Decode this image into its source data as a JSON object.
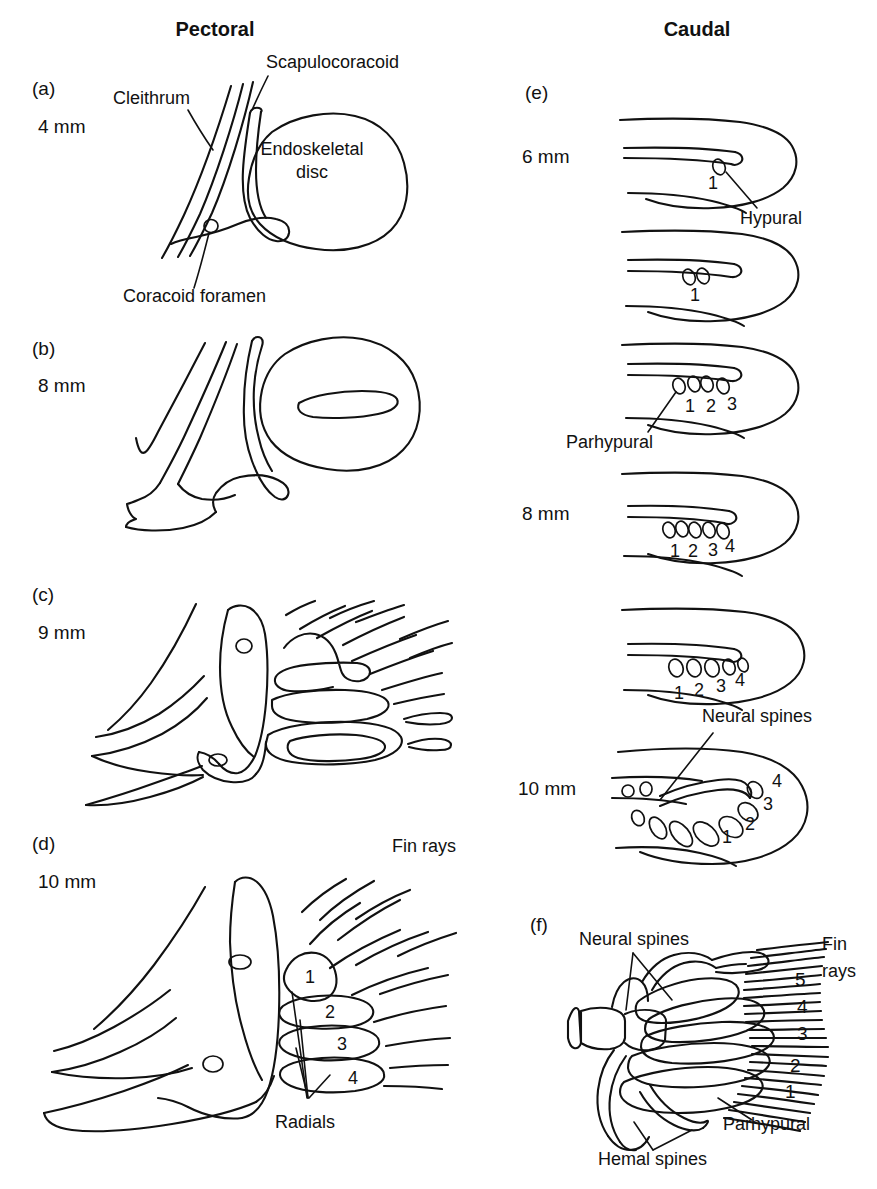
{
  "figure": {
    "background": "#ffffff",
    "ink_color": "#111111",
    "headings": [
      {
        "id": "pectoral",
        "label": "Pectoral"
      },
      {
        "id": "caudal",
        "label": "Caudal"
      }
    ]
  },
  "pectoral": {
    "panels": [
      {
        "key": "a",
        "panel_label": "(a)",
        "size_label": "4 mm",
        "annotations": [
          {
            "name": "cleithrum",
            "text": "Cleithrum"
          },
          {
            "name": "scapulocoracoid",
            "text": "Scapulocoracoid"
          },
          {
            "name": "endoskeletal-disc-line1",
            "text": "Endoskeletal"
          },
          {
            "name": "endoskeletal-disc-line2",
            "text": "disc"
          },
          {
            "name": "coracoid-foramen",
            "text": "Coracoid foramen"
          }
        ]
      },
      {
        "key": "b",
        "panel_label": "(b)",
        "size_label": "8 mm",
        "annotations": []
      },
      {
        "key": "c",
        "panel_label": "(c)",
        "size_label": "9 mm",
        "annotations": []
      },
      {
        "key": "d",
        "panel_label": "(d)",
        "size_label": "10 mm",
        "annotations": [
          {
            "name": "fin-rays",
            "text": "Fin rays"
          },
          {
            "name": "radials",
            "text": "Radials"
          }
        ],
        "radial_numbers": [
          "1",
          "2",
          "3",
          "4"
        ]
      }
    ]
  },
  "caudal": {
    "panels": [
      {
        "key": "e",
        "panel_label": "(e)",
        "size_labels": [
          "6 mm",
          "8 mm",
          "10 mm"
        ],
        "stages": [
          {
            "index": 1,
            "numbers": [
              "1"
            ],
            "annotations": [
              {
                "name": "hypural",
                "text": "Hypural"
              }
            ]
          },
          {
            "index": 2,
            "numbers": [
              "1"
            ],
            "annotations": []
          },
          {
            "index": 3,
            "numbers": [
              "1",
              "2",
              "3"
            ],
            "annotations": [
              {
                "name": "parhypural",
                "text": "Parhypural"
              }
            ]
          },
          {
            "index": 4,
            "numbers": [
              "1",
              "2",
              "3",
              "4"
            ],
            "annotations": []
          },
          {
            "index": 5,
            "numbers": [
              "1",
              "2",
              "3",
              "4"
            ],
            "annotations": []
          },
          {
            "index": 6,
            "numbers": [
              "1",
              "2",
              "3",
              "4"
            ],
            "annotations": [
              {
                "name": "neural-spines",
                "text": "Neural spines"
              }
            ]
          }
        ]
      },
      {
        "key": "f",
        "panel_label": "(f)",
        "annotations": [
          {
            "name": "neural-spines",
            "text": "Neural spines"
          },
          {
            "name": "fin-rays-line1",
            "text": "Fin"
          },
          {
            "name": "fin-rays-line2",
            "text": "rays"
          },
          {
            "name": "parhypural",
            "text": "Parhypural"
          },
          {
            "name": "hemal-spines",
            "text": "Hemal spines"
          }
        ],
        "hypural_numbers": [
          "5",
          "4",
          "3",
          "2",
          "1"
        ]
      }
    ]
  }
}
